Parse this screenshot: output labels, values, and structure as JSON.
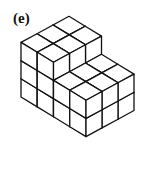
{
  "figure": {
    "label": "(e)",
    "colors": {
      "line": "#111111",
      "face": "#ffffff",
      "background": "#ffffff"
    },
    "geometry": {
      "origin_left_bottom": [
        21,
        97
      ],
      "unit_down_right": [
        16.25,
        9.9
      ],
      "unit_up_right": [
        16,
        -8.7
      ],
      "unit_height": 18.2
    },
    "heights_grid_note": "rows along down-right (back to front), columns along up-right",
    "heights": [
      [
        3,
        3,
        3
      ],
      [
        3,
        3,
        3
      ],
      [
        2,
        2,
        2
      ],
      [
        2,
        2,
        2
      ]
    ]
  }
}
